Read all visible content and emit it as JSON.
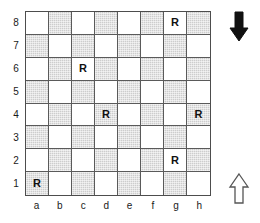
{
  "chart_data": {
    "type": "table",
    "board": {
      "files": [
        "a",
        "b",
        "c",
        "d",
        "e",
        "f",
        "g",
        "h"
      ],
      "ranks": [
        "8",
        "7",
        "6",
        "5",
        "4",
        "3",
        "2",
        "1"
      ],
      "light_color": "#ffffff",
      "dark_color": "#cdcdcd",
      "border_color": "#4d4d4d",
      "grid_line_color": "#5a5a5a",
      "a1_square_shade": "dark",
      "pieces": [
        {
          "square": "g8",
          "label": "R",
          "file": "g",
          "rank": "8",
          "shade": "light"
        },
        {
          "square": "c6",
          "label": "R",
          "file": "c",
          "rank": "6",
          "shade": "light"
        },
        {
          "square": "d4",
          "label": "R",
          "file": "d",
          "rank": "4",
          "shade": "dark"
        },
        {
          "square": "h4",
          "label": "R",
          "file": "h",
          "rank": "4",
          "shade": "dark"
        },
        {
          "square": "g2",
          "label": "R",
          "file": "g",
          "rank": "2",
          "shade": "light"
        },
        {
          "square": "a1",
          "label": "R",
          "file": "a",
          "rank": "1",
          "shade": "dark"
        }
      ],
      "piece_count": 6,
      "piece_symbol": "R"
    },
    "annotations": [
      {
        "name": "arrow-down",
        "direction": "down",
        "style": "filled",
        "color": "#111111",
        "position": "top-right"
      },
      {
        "name": "arrow-up",
        "direction": "up",
        "style": "outline",
        "color": "#ffffff",
        "stroke": "#555555",
        "position": "bottom-right"
      }
    ]
  },
  "board": {
    "rank_labels": [
      "8",
      "7",
      "6",
      "5",
      "4",
      "3",
      "2",
      "1"
    ],
    "file_labels": [
      "a",
      "b",
      "c",
      "d",
      "e",
      "f",
      "g",
      "h"
    ],
    "squares": [
      [
        {
          "id": "a8",
          "shade": "light",
          "piece": ""
        },
        {
          "id": "b8",
          "shade": "dark",
          "piece": ""
        },
        {
          "id": "c8",
          "shade": "light",
          "piece": ""
        },
        {
          "id": "d8",
          "shade": "dark",
          "piece": ""
        },
        {
          "id": "e8",
          "shade": "light",
          "piece": ""
        },
        {
          "id": "f8",
          "shade": "dark",
          "piece": ""
        },
        {
          "id": "g8",
          "shade": "light",
          "piece": "R"
        },
        {
          "id": "h8",
          "shade": "dark",
          "piece": ""
        }
      ],
      [
        {
          "id": "a7",
          "shade": "dark",
          "piece": ""
        },
        {
          "id": "b7",
          "shade": "light",
          "piece": ""
        },
        {
          "id": "c7",
          "shade": "dark",
          "piece": ""
        },
        {
          "id": "d7",
          "shade": "light",
          "piece": ""
        },
        {
          "id": "e7",
          "shade": "dark",
          "piece": ""
        },
        {
          "id": "f7",
          "shade": "light",
          "piece": ""
        },
        {
          "id": "g7",
          "shade": "dark",
          "piece": ""
        },
        {
          "id": "h7",
          "shade": "light",
          "piece": ""
        }
      ],
      [
        {
          "id": "a6",
          "shade": "light",
          "piece": ""
        },
        {
          "id": "b6",
          "shade": "dark",
          "piece": ""
        },
        {
          "id": "c6",
          "shade": "light",
          "piece": "R"
        },
        {
          "id": "d6",
          "shade": "dark",
          "piece": ""
        },
        {
          "id": "e6",
          "shade": "light",
          "piece": ""
        },
        {
          "id": "f6",
          "shade": "dark",
          "piece": ""
        },
        {
          "id": "g6",
          "shade": "light",
          "piece": ""
        },
        {
          "id": "h6",
          "shade": "dark",
          "piece": ""
        }
      ],
      [
        {
          "id": "a5",
          "shade": "dark",
          "piece": ""
        },
        {
          "id": "b5",
          "shade": "light",
          "piece": ""
        },
        {
          "id": "c5",
          "shade": "dark",
          "piece": ""
        },
        {
          "id": "d5",
          "shade": "light",
          "piece": ""
        },
        {
          "id": "e5",
          "shade": "dark",
          "piece": ""
        },
        {
          "id": "f5",
          "shade": "light",
          "piece": ""
        },
        {
          "id": "g5",
          "shade": "dark",
          "piece": ""
        },
        {
          "id": "h5",
          "shade": "light",
          "piece": ""
        }
      ],
      [
        {
          "id": "a4",
          "shade": "light",
          "piece": ""
        },
        {
          "id": "b4",
          "shade": "dark",
          "piece": ""
        },
        {
          "id": "c4",
          "shade": "light",
          "piece": ""
        },
        {
          "id": "d4",
          "shade": "dark",
          "piece": "R"
        },
        {
          "id": "e4",
          "shade": "light",
          "piece": ""
        },
        {
          "id": "f4",
          "shade": "dark",
          "piece": ""
        },
        {
          "id": "g4",
          "shade": "light",
          "piece": ""
        },
        {
          "id": "h4",
          "shade": "dark",
          "piece": "R"
        }
      ],
      [
        {
          "id": "a3",
          "shade": "dark",
          "piece": ""
        },
        {
          "id": "b3",
          "shade": "light",
          "piece": ""
        },
        {
          "id": "c3",
          "shade": "dark",
          "piece": ""
        },
        {
          "id": "d3",
          "shade": "light",
          "piece": ""
        },
        {
          "id": "e3",
          "shade": "dark",
          "piece": ""
        },
        {
          "id": "f3",
          "shade": "light",
          "piece": ""
        },
        {
          "id": "g3",
          "shade": "dark",
          "piece": ""
        },
        {
          "id": "h3",
          "shade": "light",
          "piece": ""
        }
      ],
      [
        {
          "id": "a2",
          "shade": "light",
          "piece": ""
        },
        {
          "id": "b2",
          "shade": "dark",
          "piece": ""
        },
        {
          "id": "c2",
          "shade": "light",
          "piece": ""
        },
        {
          "id": "d2",
          "shade": "dark",
          "piece": ""
        },
        {
          "id": "e2",
          "shade": "light",
          "piece": ""
        },
        {
          "id": "f2",
          "shade": "dark",
          "piece": ""
        },
        {
          "id": "g2",
          "shade": "light",
          "piece": "R"
        },
        {
          "id": "h2",
          "shade": "dark",
          "piece": ""
        }
      ],
      [
        {
          "id": "a1",
          "shade": "dark",
          "piece": "R"
        },
        {
          "id": "b1",
          "shade": "light",
          "piece": ""
        },
        {
          "id": "c1",
          "shade": "dark",
          "piece": ""
        },
        {
          "id": "d1",
          "shade": "light",
          "piece": ""
        },
        {
          "id": "e1",
          "shade": "dark",
          "piece": ""
        },
        {
          "id": "f1",
          "shade": "light",
          "piece": ""
        },
        {
          "id": "g1",
          "shade": "dark",
          "piece": ""
        },
        {
          "id": "h1",
          "shade": "light",
          "piece": ""
        }
      ]
    ]
  },
  "arrows": {
    "top": {
      "name": "arrow-down-icon",
      "direction": "down",
      "filled": true
    },
    "bottom": {
      "name": "arrow-up-icon",
      "direction": "up",
      "filled": false
    }
  }
}
